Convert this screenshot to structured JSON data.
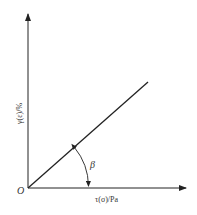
{
  "diagram": {
    "type": "linear-relationship-plot",
    "origin_label": "O",
    "x_axis": {
      "label": "τ(σ)/Pa"
    },
    "y_axis": {
      "label": "γ(ε)/%"
    },
    "line": {
      "description": "straight line from origin",
      "angle_label": "β"
    },
    "colors": {
      "stroke": "#222222",
      "text": "#333333",
      "background": "#ffffff"
    }
  }
}
